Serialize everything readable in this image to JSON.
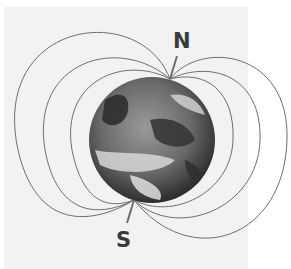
{
  "diagram": {
    "labels": {
      "north": "N",
      "south": "S"
    },
    "colors": {
      "panel": "#f2f2f2",
      "field_line": "#6e6e6e",
      "label": "#3a3a3a"
    },
    "field_lines_per_side": 3
  }
}
